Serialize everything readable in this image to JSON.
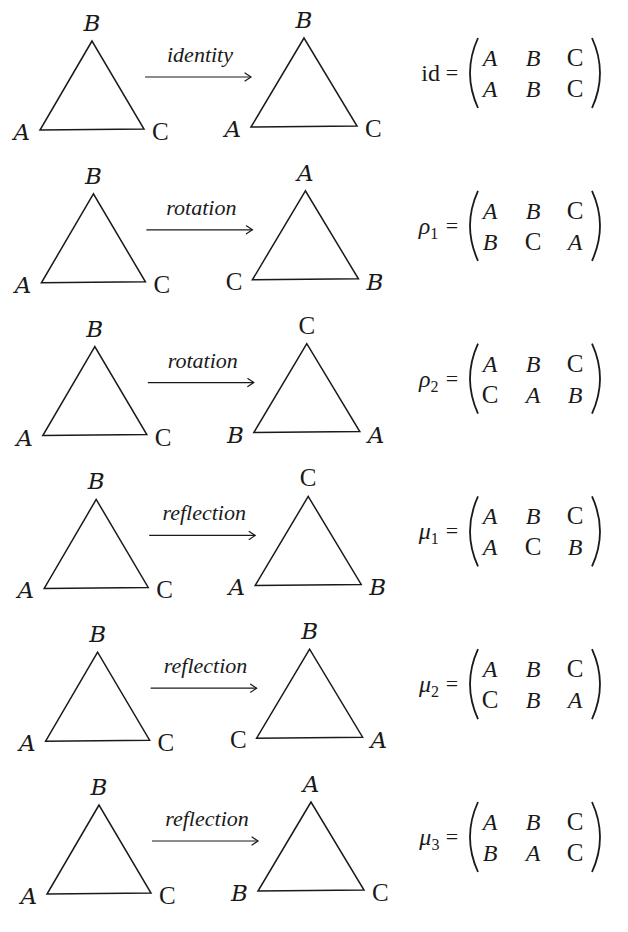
{
  "figure": {
    "rows": [
      {
        "operation": "identity",
        "source": {
          "top": "B",
          "left": "A",
          "right": "C"
        },
        "target": {
          "top": "B",
          "left": "A",
          "right": "C"
        },
        "name": "id",
        "name_upright": true,
        "subscript": "",
        "matrix": {
          "top": [
            "A",
            "B",
            "C"
          ],
          "bottom": [
            "A",
            "B",
            "C"
          ]
        }
      },
      {
        "operation": "rotation",
        "source": {
          "top": "B",
          "left": "A",
          "right": "C"
        },
        "target": {
          "top": "A",
          "left": "C",
          "right": "B"
        },
        "name": "ρ",
        "name_upright": false,
        "subscript": "1",
        "matrix": {
          "top": [
            "A",
            "B",
            "C"
          ],
          "bottom": [
            "B",
            "C",
            "A"
          ]
        }
      },
      {
        "operation": "rotation",
        "source": {
          "top": "B",
          "left": "A",
          "right": "C"
        },
        "target": {
          "top": "C",
          "left": "B",
          "right": "A"
        },
        "name": "ρ",
        "name_upright": false,
        "subscript": "2",
        "matrix": {
          "top": [
            "A",
            "B",
            "C"
          ],
          "bottom": [
            "C",
            "A",
            "B"
          ]
        }
      },
      {
        "operation": "reflection",
        "source": {
          "top": "B",
          "left": "A",
          "right": "C"
        },
        "target": {
          "top": "C",
          "left": "A",
          "right": "B"
        },
        "name": "μ",
        "name_upright": false,
        "subscript": "1",
        "matrix": {
          "top": [
            "A",
            "B",
            "C"
          ],
          "bottom": [
            "A",
            "C",
            "B"
          ]
        }
      },
      {
        "operation": "reflection",
        "source": {
          "top": "B",
          "left": "A",
          "right": "C"
        },
        "target": {
          "top": "B",
          "left": "C",
          "right": "A"
        },
        "name": "μ",
        "name_upright": false,
        "subscript": "2",
        "matrix": {
          "top": [
            "A",
            "B",
            "C"
          ],
          "bottom": [
            "C",
            "B",
            "A"
          ]
        }
      },
      {
        "operation": "reflection",
        "source": {
          "top": "B",
          "left": "A",
          "right": "C"
        },
        "target": {
          "top": "A",
          "left": "B",
          "right": "C"
        },
        "name": "μ",
        "name_upright": false,
        "subscript": "3",
        "matrix": {
          "top": [
            "A",
            "B",
            "C"
          ],
          "bottom": [
            "B",
            "A",
            "C"
          ]
        }
      }
    ],
    "equals_sign": "="
  }
}
